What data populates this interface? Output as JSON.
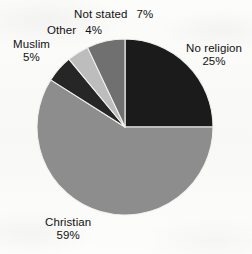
{
  "chart_data": {
    "type": "pie",
    "title": "",
    "xlabel": "",
    "ylabel": "",
    "categories": [
      "No religion",
      "Christian",
      "Muslim",
      "Other",
      "Not stated"
    ],
    "values": [
      25,
      59,
      5,
      4,
      7
    ],
    "value_unit": "%",
    "labels": [
      {
        "name": "No religion",
        "percent": "25%",
        "value": 25,
        "color": "#1b1b1b"
      },
      {
        "name": "Christian",
        "percent": "59%",
        "value": 59,
        "color": "#8d8d8d"
      },
      {
        "name": "Muslim",
        "percent": "5%",
        "value": 5,
        "color": "#262626"
      },
      {
        "name": "Other",
        "percent": "4%",
        "value": 4,
        "color": "#bdbdbd"
      },
      {
        "name": "Not stated",
        "percent": "7%",
        "value": 7,
        "color": "#707070"
      }
    ],
    "start_angle_deg": 0,
    "direction": "clockwise",
    "legend_position": "outside-labels",
    "grid": false,
    "background_color": "#fbfbfa",
    "slice_separator_color": "#f2f2f0"
  },
  "geometry": {
    "center_x": 125,
    "center_y": 127,
    "radius": 88
  }
}
